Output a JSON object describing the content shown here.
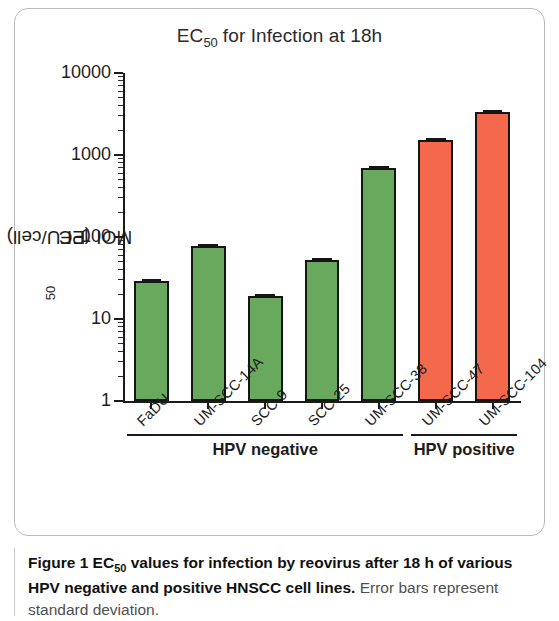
{
  "chart_data": {
    "type": "bar",
    "title_prefix": "EC",
    "title_sub": "50",
    "title_suffix": " for Infection at 18h",
    "title": "EC50 for Infection at 18h",
    "ylabel_prefix": "EC ",
    "ylabel_sub": "50",
    "ylabel_suffix": " MOI (PFU/cell)",
    "ylabel": "EC 50 MOI (PFU/cell)",
    "xlabel": "",
    "scale": "log10",
    "ylim": [
      1,
      10000
    ],
    "ytick_labels": [
      "10000",
      "1000",
      "100",
      "10",
      "1"
    ],
    "ytick_values": [
      10000,
      1000,
      100,
      10,
      1
    ],
    "grid": false,
    "legend": false,
    "categories": [
      "FaDU",
      "UM-SCC-14A",
      "SCC-9",
      "SCC-25",
      "UM-SCC-38",
      "UM-SCC-47",
      "UM-SCC-104"
    ],
    "values": [
      29,
      78,
      19,
      53,
      690,
      1520,
      3300
    ],
    "errors": [
      3,
      4,
      1,
      3,
      40,
      80,
      150
    ],
    "colors": [
      "green",
      "green",
      "green",
      "green",
      "green",
      "red",
      "red"
    ],
    "series": [
      {
        "name": "EC50 MOI (PFU/cell)",
        "values": [
          29,
          78,
          19,
          53,
          690,
          1520,
          3300
        ]
      }
    ],
    "groups": [
      {
        "label": "HPV negative",
        "from": 0,
        "to": 4
      },
      {
        "label": "HPV positive",
        "from": 5,
        "to": 6
      }
    ],
    "color_map": {
      "green": "#69a95d",
      "red": "#f4694c",
      "outline": "#151515"
    },
    "annotations": [
      "Error bars represent standard deviation."
    ]
  },
  "caption": {
    "figure_label": "Figure 1",
    "bold_prefix": "EC",
    "bold_sub": "50",
    "bold_text": " values for infection by reovirus after 18 h of various HPV negative and positive HNSCC cell lines.",
    "normal_text": " Error bars represent standard deviation."
  }
}
